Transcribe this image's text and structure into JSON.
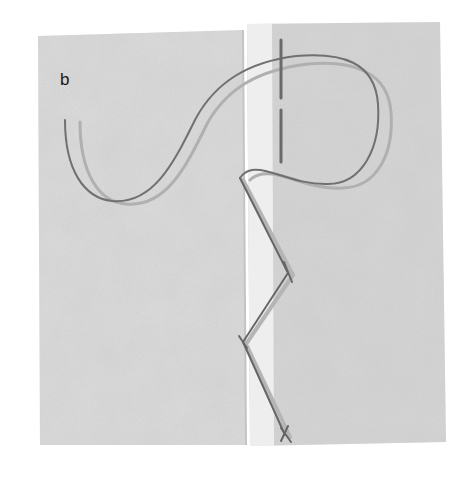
{
  "figure": {
    "panel_label": "b",
    "colors": {
      "background": "#ffffff",
      "fabric_left": "#dcdcdc",
      "fabric_right": "#d6d6d6",
      "seam_gap": "#f2f2f2",
      "thread_dark": "#6e6e6e",
      "thread_light": "#a8a8a8"
    }
  }
}
